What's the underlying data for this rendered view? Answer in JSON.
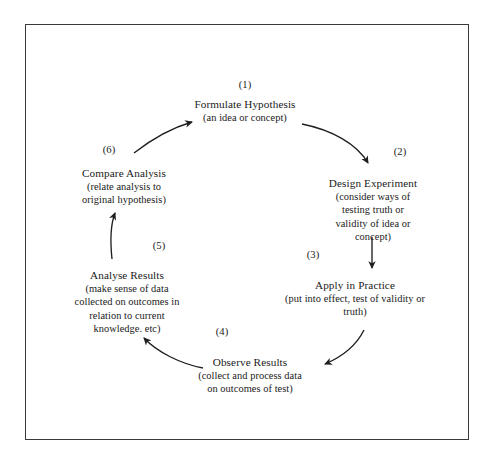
{
  "diagram": {
    "border_color": "#3a3a3a",
    "text_color": "#1a1a1a",
    "background": "#ffffff",
    "steps": [
      {
        "number": "(1)",
        "title": "Formulate Hypothesis",
        "description": "(an idea or concept)"
      },
      {
        "number": "(2)",
        "title": "Design Experiment",
        "description": "(consider ways of\ntesting truth or\nvalidity of idea or\nconcept)"
      },
      {
        "number": "(3)",
        "title": "Apply in Practice",
        "description": "(put into effect, test of validity or\ntruth)"
      },
      {
        "number": "(4)",
        "title": "Observe Results",
        "description": "(collect and process data\non outcomes of test)"
      },
      {
        "number": "(5)",
        "title": "Analyse Results",
        "description": "(make sense of data\ncollected on outcomes in\nrelation to current\nknowledge. etc)"
      },
      {
        "number": "(6)",
        "title": "Compare Analysis",
        "description": "(relate analysis to\noriginal hypothesis)"
      }
    ],
    "connectors": [
      {
        "from": "(1)",
        "to": "(2)",
        "shape": "curve-down-right"
      },
      {
        "from": "(2)",
        "to": "(3)",
        "shape": "straight-down"
      },
      {
        "from": "(3)",
        "to": "(4)",
        "shape": "curve-down-left"
      },
      {
        "from": "(4)",
        "to": "(5)",
        "shape": "curve-up-left"
      },
      {
        "from": "(5)",
        "to": "(6)",
        "shape": "straight-up"
      },
      {
        "from": "(6)",
        "to": "(1)",
        "shape": "curve-up-right"
      }
    ]
  }
}
